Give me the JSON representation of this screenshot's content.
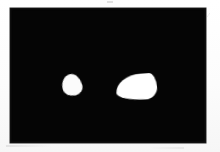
{
  "figure": {
    "medium": "scanned-grayscale-photograph",
    "background_color": "#fdfdfd",
    "plate": {
      "name": "dark-field-image-plate",
      "fill_color": "#050505",
      "left": 10,
      "top": 8,
      "width": 196,
      "height": 135
    },
    "objects": [
      {
        "id": "blob-left",
        "label": "",
        "description": "small bright rounded irregular object",
        "fill_color": "#fbfbfb",
        "center_x": 72,
        "center_y": 85,
        "width": 20,
        "height": 22,
        "rotation_deg": -14
      },
      {
        "id": "blob-right",
        "label": "",
        "description": "larger bright teardrop shaped object with apex pointing right",
        "fill_color": "#ffffff",
        "center_x": 136,
        "center_y": 87,
        "width": 41,
        "height": 26,
        "rotation_deg": -4
      }
    ],
    "artifacts": [
      {
        "id": "artifact-right-mark",
        "glyph": "⁄",
        "color": "#b9b9b9"
      },
      {
        "id": "artifact-top-mark",
        "glyph": "",
        "color": "#d6d6d6"
      },
      {
        "id": "artifact-bottom-smudge",
        "glyph": "",
        "color": "#c8c8c8"
      },
      {
        "id": "artifact-bottom-smudge-2",
        "glyph": "",
        "color": "#cecece"
      }
    ]
  }
}
